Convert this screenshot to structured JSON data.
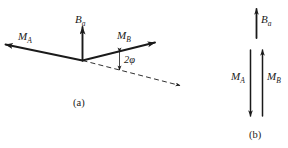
{
  "figure": {
    "background_color": "#ffffff",
    "ink_color": "#1a1a1a",
    "panels": [
      {
        "id": "a",
        "caption": "(a)",
        "description": "Two moment vectors M_A and M_B splayed symmetrically about a dashed reference axis, with resultant B_a vertical at the vertex; angle between M_B and the dashed axis labelled 2φ."
      },
      {
        "id": "b",
        "caption": "(b)",
        "description": "Antiparallel arrangement: B_a upward above, M_A downward and M_B upward side by side below."
      }
    ]
  },
  "panel_a": {
    "caption": "(a)",
    "vector_ma": {
      "symbol": "M",
      "subscript": "A",
      "direction": "up-left"
    },
    "vector_mb": {
      "symbol": "M",
      "subscript": "B",
      "direction": "up-right"
    },
    "vector_ba": {
      "symbol": "B",
      "subscript": "a",
      "direction": "up"
    },
    "angle_label": "2φ",
    "dashed_axis": {
      "style": "dashed",
      "direction": "down-right",
      "arrowhead": true
    }
  },
  "panel_b": {
    "caption": "(b)",
    "vector_ba": {
      "symbol": "B",
      "subscript": "a",
      "direction": "up"
    },
    "vector_ma": {
      "symbol": "M",
      "subscript": "A",
      "direction": "down"
    },
    "vector_mb": {
      "symbol": "M",
      "subscript": "B",
      "direction": "up"
    }
  }
}
